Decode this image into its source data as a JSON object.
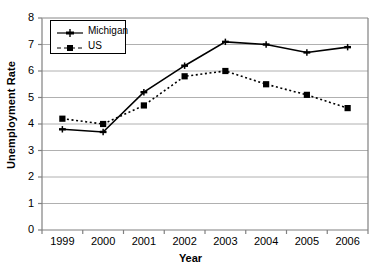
{
  "chart_data": {
    "type": "line",
    "title": "",
    "subtitle": "",
    "xlabel": "Year",
    "ylabel": "Unemployment Rate",
    "categories": [
      "1999",
      "2000",
      "2001",
      "2002",
      "2003",
      "2004",
      "2005",
      "2006"
    ],
    "x": [
      1999,
      2000,
      2001,
      2002,
      2003,
      2004,
      2005,
      2006
    ],
    "ylim": [
      0,
      8
    ],
    "yticks": [
      "0",
      "1",
      "2",
      "3",
      "4",
      "5",
      "6",
      "7",
      "8"
    ],
    "grid": "horizontal",
    "legend_position": "top-left-inside",
    "series": [
      {
        "name": "Michigan",
        "values": [
          3.8,
          3.7,
          5.2,
          6.2,
          7.1,
          7.0,
          6.7,
          6.9
        ],
        "style": "solid",
        "marker": "plus",
        "color": "#000000"
      },
      {
        "name": "US",
        "values": [
          4.2,
          4.0,
          4.7,
          5.8,
          6.0,
          5.5,
          5.1,
          4.6
        ],
        "style": "dotted",
        "marker": "square",
        "color": "#000000"
      }
    ]
  },
  "legend": {
    "items": [
      {
        "label": "Michigan"
      },
      {
        "label": "US"
      }
    ]
  },
  "axes": {
    "y_title": "Unemployment Rate",
    "x_title": "Year"
  }
}
